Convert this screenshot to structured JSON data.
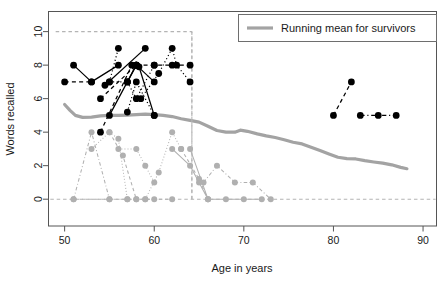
{
  "chart_data": {
    "type": "line",
    "title": "",
    "xlabel": "Age in years",
    "ylabel": "Words recalled",
    "xlim": [
      48.2,
      91.5
    ],
    "ylim": [
      -1.6,
      11.2
    ],
    "xticks": [
      50,
      60,
      70,
      80,
      90
    ],
    "yticks": [
      0,
      2,
      4,
      6,
      8,
      10
    ],
    "grid": false,
    "legend": {
      "position": "top-right",
      "entries": [
        {
          "label": "Running mean for survivors",
          "color": "#a3a3a3",
          "style": "solid-thick"
        }
      ]
    },
    "reference_lines": [
      {
        "orientation": "horizontal",
        "value": 10,
        "color": "#b4b4b4",
        "style": "dashed",
        "x_from": 49,
        "x_to": 64.2
      },
      {
        "orientation": "horizontal",
        "value": 0,
        "color": "#b4b4b4",
        "style": "dashed",
        "x_from": 48.4,
        "x_to": 91.4
      },
      {
        "orientation": "vertical",
        "value": 64.2,
        "color": "#b4b4b4",
        "style": "dashed",
        "y_from": 0,
        "y_to": 10
      }
    ],
    "series": [
      {
        "name": "Running mean for survivors",
        "group": "running-mean",
        "color": "#a3a3a3",
        "style": "solid-thick",
        "markers": false,
        "points": [
          [
            50.0,
            5.65
          ],
          [
            50.6,
            5.3
          ],
          [
            51.2,
            5.0
          ],
          [
            52.0,
            4.88
          ],
          [
            53.0,
            4.9
          ],
          [
            54.0,
            4.97
          ],
          [
            55.0,
            5.0
          ],
          [
            56.0,
            5.0
          ],
          [
            57.0,
            5.02
          ],
          [
            58.0,
            5.05
          ],
          [
            59.0,
            5.08
          ],
          [
            60.0,
            5.05
          ],
          [
            61.0,
            5.0
          ],
          [
            62.0,
            4.93
          ],
          [
            63.0,
            4.8
          ],
          [
            64.0,
            4.7
          ],
          [
            65.0,
            4.6
          ],
          [
            66.0,
            4.35
          ],
          [
            67.0,
            4.1
          ],
          [
            68.0,
            4.0
          ],
          [
            69.0,
            4.0
          ],
          [
            69.6,
            4.12
          ],
          [
            70.4,
            4.05
          ],
          [
            71.5,
            3.9
          ],
          [
            72.5,
            3.78
          ],
          [
            73.5,
            3.68
          ],
          [
            74.5,
            3.55
          ],
          [
            75.5,
            3.4
          ],
          [
            76.5,
            3.3
          ],
          [
            77.5,
            3.1
          ],
          [
            78.5,
            2.9
          ],
          [
            79.5,
            2.7
          ],
          [
            80.5,
            2.5
          ],
          [
            81.5,
            2.42
          ],
          [
            82.5,
            2.4
          ],
          [
            83.5,
            2.3
          ],
          [
            84.5,
            2.22
          ],
          [
            85.5,
            2.15
          ],
          [
            86.5,
            2.05
          ],
          [
            87.5,
            1.9
          ],
          [
            88.2,
            1.82
          ]
        ]
      },
      {
        "name": "black-solid-a",
        "group": "black",
        "color": "#000000",
        "style": "solid",
        "points": [
          [
            51.0,
            8
          ],
          [
            53.0,
            7
          ],
          [
            56.0,
            8
          ]
        ]
      },
      {
        "name": "black-solid-b",
        "group": "black",
        "color": "#000000",
        "style": "solid",
        "points": [
          [
            55.0,
            5
          ],
          [
            57.0,
            7
          ],
          [
            58.0,
            8
          ]
        ]
      },
      {
        "name": "black-solid-c",
        "group": "black",
        "color": "#000000",
        "style": "solid",
        "points": [
          [
            54.5,
            6.8
          ],
          [
            59.0,
            9
          ]
        ]
      },
      {
        "name": "black-solid-d",
        "group": "black",
        "color": "#000000",
        "style": "solid",
        "points": [
          [
            58.0,
            8
          ],
          [
            60.0,
            7
          ]
        ]
      },
      {
        "name": "black-solid-e",
        "group": "black",
        "color": "#000000",
        "style": "solid",
        "points": [
          [
            58.3,
            7.9
          ],
          [
            60.0,
            5
          ]
        ]
      },
      {
        "name": "black-solid-f",
        "group": "black",
        "color": "#000000",
        "style": "solid",
        "points": [
          [
            57.0,
            7
          ],
          [
            58.0,
            8
          ]
        ]
      },
      {
        "name": "black-dashed-a",
        "group": "black",
        "color": "#000000",
        "style": "dashed",
        "points": [
          [
            50.0,
            7
          ],
          [
            53.0,
            7
          ]
        ]
      },
      {
        "name": "black-dashed-b",
        "group": "black",
        "color": "#000000",
        "style": "dashed",
        "points": [
          [
            54.0,
            6
          ],
          [
            58.0,
            8
          ]
        ]
      },
      {
        "name": "black-dashed-c",
        "group": "black",
        "color": "#000000",
        "style": "dashed",
        "points": [
          [
            54.0,
            4
          ],
          [
            57.5,
            8
          ]
        ]
      },
      {
        "name": "black-dashed-d",
        "group": "black",
        "color": "#000000",
        "style": "dashed",
        "points": [
          [
            58.0,
            8
          ],
          [
            60.0,
            8
          ],
          [
            62.0,
            8
          ],
          [
            64.0,
            8
          ]
        ]
      },
      {
        "name": "black-dashed-e",
        "group": "black",
        "color": "#000000",
        "style": "dashed",
        "points": [
          [
            80.0,
            5
          ],
          [
            82.0,
            7
          ]
        ]
      },
      {
        "name": "black-dashdot-f",
        "group": "black",
        "color": "#000000",
        "style": "dashdot",
        "points": [
          [
            83.0,
            5
          ],
          [
            85.0,
            5
          ],
          [
            87.0,
            5
          ]
        ]
      },
      {
        "name": "black-dotted-a",
        "group": "black",
        "color": "#000000",
        "style": "dotted",
        "points": [
          [
            55.0,
            7
          ],
          [
            56.0,
            9
          ]
        ]
      },
      {
        "name": "black-dotted-b",
        "group": "black",
        "color": "#000000",
        "style": "dotted",
        "points": [
          [
            55.0,
            7
          ],
          [
            57.0,
            7
          ],
          [
            58.0,
            6
          ],
          [
            60.0,
            8
          ]
        ]
      },
      {
        "name": "black-dotted-c",
        "group": "black",
        "color": "#000000",
        "style": "dotted",
        "points": [
          [
            58.5,
            6
          ],
          [
            60.5,
            7.5
          ],
          [
            62.0,
            9
          ],
          [
            62.5,
            8
          ],
          [
            64.0,
            7
          ]
        ]
      },
      {
        "name": "black-dotted-d",
        "group": "black",
        "color": "#000000",
        "style": "dotted",
        "points": [
          [
            57.0,
            5.2
          ],
          [
            58.0,
            7
          ],
          [
            60.0,
            5
          ]
        ]
      },
      {
        "name": "gray-dashdot-a",
        "group": "gray",
        "color": "#b0b0b0",
        "style": "dashdot",
        "points": [
          [
            51.0,
            0
          ],
          [
            53.0,
            4
          ],
          [
            55.0,
            0
          ]
        ]
      },
      {
        "name": "gray-dotted-b",
        "group": "gray",
        "color": "#b0b0b0",
        "style": "dotted",
        "points": [
          [
            53.0,
            3
          ],
          [
            55.0,
            4
          ],
          [
            56.0,
            3.6
          ],
          [
            57.0,
            0
          ]
        ]
      },
      {
        "name": "gray-dotted-c",
        "group": "gray",
        "color": "#b0b0b0",
        "style": "dotted",
        "points": [
          [
            56.0,
            3
          ],
          [
            58.0,
            3
          ],
          [
            59.0,
            2
          ],
          [
            60.0,
            1
          ]
        ]
      },
      {
        "name": "gray-dashed-d",
        "group": "gray",
        "color": "#b0b0b0",
        "style": "dashed",
        "points": [
          [
            55.0,
            4
          ],
          [
            56.5,
            2.6
          ],
          [
            58.0,
            0
          ]
        ]
      },
      {
        "name": "gray-dotted-e",
        "group": "gray",
        "color": "#b0b0b0",
        "style": "dotted",
        "points": [
          [
            59.0,
            0
          ],
          [
            60.5,
            1.6
          ],
          [
            62.0,
            4
          ],
          [
            63.0,
            3
          ]
        ]
      },
      {
        "name": "gray-solid-f",
        "group": "gray",
        "color": "#b0b0b0",
        "style": "solid",
        "points": [
          [
            62.0,
            3
          ],
          [
            64.0,
            2
          ],
          [
            65.0,
            1
          ],
          [
            66.0,
            0
          ]
        ]
      },
      {
        "name": "gray-dashed-g",
        "group": "gray",
        "color": "#b0b0b0",
        "style": "dashed",
        "points": [
          [
            63.0,
            3
          ],
          [
            65.0,
            1.2
          ],
          [
            66.0,
            0
          ]
        ]
      },
      {
        "name": "gray-solid-h",
        "group": "gray",
        "color": "#b0b0b0",
        "style": "solid",
        "points": [
          [
            64.0,
            3
          ],
          [
            66.0,
            0
          ],
          [
            68.0,
            0
          ],
          [
            70.0,
            0
          ],
          [
            72.0,
            0
          ]
        ]
      },
      {
        "name": "gray-dashdot-i",
        "group": "gray",
        "color": "#b0b0b0",
        "style": "dashdot",
        "points": [
          [
            65.5,
            1
          ],
          [
            67.0,
            2
          ],
          [
            69.0,
            1
          ],
          [
            71.0,
            1
          ],
          [
            73.0,
            0
          ]
        ]
      },
      {
        "name": "gray-baseline-j",
        "group": "gray",
        "color": "#b0b0b0",
        "style": "dashed",
        "points": [
          [
            51.0,
            0
          ],
          [
            55.0,
            0
          ],
          [
            57.0,
            0
          ],
          [
            58.0,
            0
          ],
          [
            59.0,
            0
          ],
          [
            60.0,
            0
          ],
          [
            62.0,
            0
          ]
        ]
      },
      {
        "name": "gray-top-vertical",
        "group": "gray",
        "color": "#b4b4b4",
        "style": "dashed",
        "points": [
          [
            64.2,
            10
          ],
          [
            64.2,
            0
          ]
        ]
      }
    ],
    "markers": {
      "black": {
        "shape": "circle",
        "size": 3.4,
        "color": "#000000"
      },
      "gray": {
        "shape": "circle",
        "size": 3.0,
        "color": "#b0b0b0"
      }
    }
  },
  "axes": {
    "x_title": "Age in years",
    "y_title": "Words recalled",
    "x_tick_labels": [
      "50",
      "60",
      "70",
      "80",
      "90"
    ],
    "y_tick_labels": [
      "0",
      "2",
      "4",
      "6",
      "8",
      "10"
    ]
  },
  "legend": {
    "entry_label": "Running mean for survivors"
  }
}
